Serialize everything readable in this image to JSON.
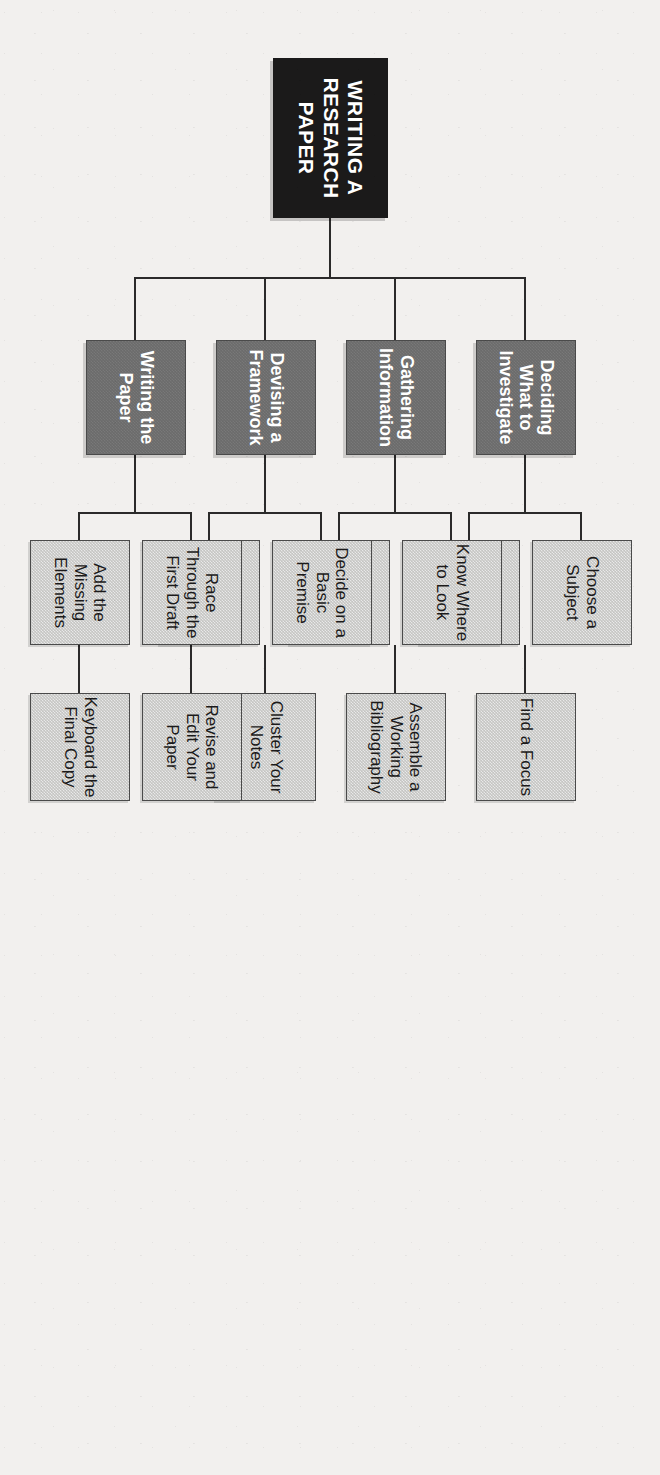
{
  "diagram": {
    "type": "hierarchy-tree",
    "orientation": "rotated-90-clockwise",
    "colors": {
      "page_background": "#f2f0ee",
      "root_fill": "#1b1a1a",
      "root_text": "#ffffff",
      "level1_fill": "#6b6b6b",
      "level1_text": "#ffffff",
      "level2_fill": "#c5c5c3",
      "level2_text": "#1b1a1a",
      "connector": "#2b2a2a"
    },
    "root": {
      "label": "WRITING A RESEARCH PAPER"
    },
    "branches": [
      {
        "label": "Deciding What to Investigate",
        "children": [
          {
            "label": "Choose a Subject"
          },
          {
            "label": "Narrow Your Topic"
          },
          {
            "label": "Find a Focus"
          }
        ]
      },
      {
        "label": "Gathering Information",
        "children": [
          {
            "label": "Know Where to Look"
          },
          {
            "label": "Take Notes"
          },
          {
            "label": "Assemble a Working Bibliography"
          }
        ]
      },
      {
        "label": "Devising a Framework",
        "children": [
          {
            "label": "Decide on a Basic Premise"
          },
          {
            "label": "Plot an Organization- al Pattern"
          },
          {
            "label": "Cluster Your Notes"
          }
        ]
      },
      {
        "label": "Writing the Paper",
        "children": [
          {
            "label": "Race Through the First Draft"
          },
          {
            "label": "Add the Missing Elements"
          },
          {
            "label": "Revise and Edit Your Paper"
          },
          {
            "label": "Keyboard the Final Copy"
          }
        ]
      }
    ],
    "nodes": {
      "root": "WRITING A RESEARCH PAPER",
      "b1": "Deciding What to Investigate",
      "b1c1": "Choose a Subject",
      "b1c2": "Narrow Your Topic",
      "b1c3": "Find a Focus",
      "b2": "Gathering Information",
      "b2c1": "Know Where to Look",
      "b2c2": "Take Notes",
      "b2c3": "Assemble a Working Bibliography",
      "b3": "Devising a Framework",
      "b3c1": "Decide on a Basic Premise",
      "b3c2": "Plot an Organization- al Pattern",
      "b3c3": "Cluster Your Notes",
      "b4": "Writing the Paper",
      "b4c1": "Race Through the First Draft",
      "b4c2": "Add the Missing Elements",
      "b4c3": "Revise and Edit Your Paper",
      "b4c4": "Keyboard the Final Copy"
    }
  }
}
